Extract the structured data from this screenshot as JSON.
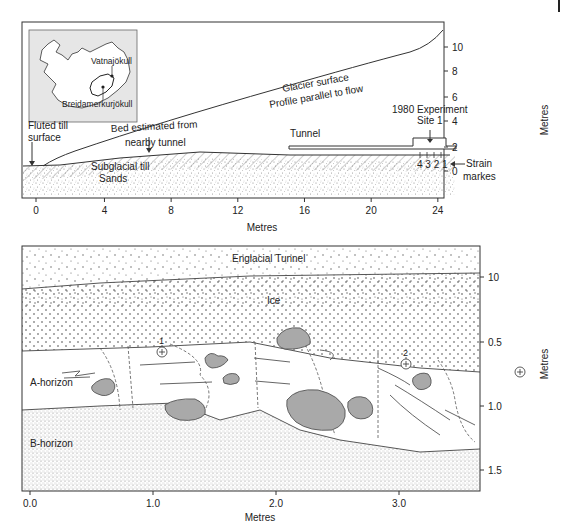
{
  "top_panel": {
    "title": "Glacier profile parallel to flow",
    "frame": {
      "x": 22,
      "y": 22,
      "w": 422,
      "h": 176
    },
    "x_axis": {
      "label": "Metres",
      "ticks": [
        {
          "value": 0,
          "label": "0",
          "px": 36
        },
        {
          "value": 4,
          "label": "4",
          "px": 113
        },
        {
          "value": 8,
          "label": "8",
          "px": 188
        },
        {
          "value": 12,
          "label": "12",
          "px": 263
        },
        {
          "value": 16,
          "label": "16",
          "px": 338
        },
        {
          "value": 20,
          "label": "20",
          "px": 413
        },
        {
          "value": 24,
          "label": "24",
          "px": 488
        }
      ]
    },
    "y_axis": {
      "label": "Metres",
      "side": "right",
      "ticks": [
        {
          "value": 10,
          "label": "10",
          "py": 47
        },
        {
          "value": 8,
          "label": "8",
          "py": 71
        },
        {
          "value": 6,
          "label": "6",
          "py": 97
        },
        {
          "value": 4,
          "label": "4",
          "py": 121
        },
        {
          "value": 2,
          "label": "2",
          "py": 147
        },
        {
          "value": 0,
          "label": "0",
          "py": 171
        }
      ]
    },
    "inset_map": {
      "labels": {
        "vatnajokull": "Vatnajökull",
        "breidamerkurjokull": "Breidamerkurjökull"
      }
    },
    "labels": {
      "glacier_surface": "Glacier surface",
      "profile_parallel": "Profile parallel to flow",
      "experiment": "1980 Experiment",
      "site": "Site 1",
      "tunnel": "Tunnel",
      "fluted_1": "Fluted till",
      "fluted_2": "surface",
      "bed_1": "Bed estimated from",
      "bed_2": "nearby tunnel",
      "till": "Subglacial till",
      "sands": "Sands",
      "strain_numbers": "4 3 2 1",
      "strain_1": "Strain",
      "strain_2": "markes"
    }
  },
  "bottom_panel": {
    "title": "Subglacial till cross-section",
    "frame": {
      "x": 22,
      "y": 246,
      "w": 458,
      "h": 245
    },
    "x_axis": {
      "label": "Metres",
      "ticks": [
        {
          "value": 0.0,
          "label": "0.0",
          "px": 30
        },
        {
          "value": 1.0,
          "label": "1.0",
          "px": 153
        },
        {
          "value": 2.0,
          "label": "2.0",
          "px": 276
        },
        {
          "value": 3.0,
          "label": "3.0",
          "px": 399
        }
      ]
    },
    "y_axis": {
      "label": "Metres",
      "side": "right",
      "ticks": [
        {
          "value": "10",
          "label": "10",
          "py": 277
        },
        {
          "value": 0.5,
          "label": "0.5",
          "py": 342
        },
        {
          "value": 1.0,
          "label": "1.0",
          "py": 406
        },
        {
          "value": 1.5,
          "label": "1.5",
          "py": 470
        }
      ]
    },
    "layers": {
      "tunnel": "Englacial Tunnel",
      "ice": "Ice",
      "a_horizon": "A-horizon",
      "b_horizon": "B-horizon"
    },
    "markers": [
      {
        "label": "1",
        "x": 162,
        "y": 352
      },
      {
        "label": "2",
        "x": 406,
        "y": 362
      },
      {
        "label": "",
        "x": 520,
        "y": 371
      }
    ]
  },
  "colors": {
    "line": "#3a3a3a",
    "clast_fill": "#a9a9a9",
    "inset_bg": "#e6e6e6",
    "dot": "#555555"
  }
}
